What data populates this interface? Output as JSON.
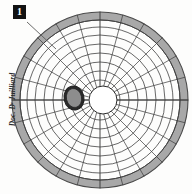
{
  "figure": {
    "badge_label": "1",
    "caption": "Doc. Dʳ Juilliard",
    "title": "",
    "background_color": "#fdfdfc"
  },
  "chart_data": {
    "type": "scatter",
    "title": "",
    "subtitle": "",
    "xlabel": "",
    "ylabel": "",
    "plot_kind": "polar-grid-visual-field-chart",
    "grid": true,
    "legend": false,
    "legend_position": "none",
    "center": {
      "x": 100,
      "y": 100
    },
    "outer_radius": 88,
    "rim": {
      "name": "outer-rim-band",
      "inner_radius": 80,
      "outer_radius": 88,
      "fill_color": "#a8a8a8",
      "stroke_color": "#4a4a4a"
    },
    "meridians": {
      "name": "radial-spokes",
      "count": 24,
      "angles_deg": [
        0,
        15,
        30,
        45,
        60,
        75,
        90,
        105,
        120,
        135,
        150,
        165,
        180,
        195,
        210,
        225,
        240,
        255,
        270,
        285,
        300,
        315,
        330,
        345
      ],
      "stroke_color": "#3c3c3c"
    },
    "isopters": {
      "name": "concentric-rings",
      "count": 8,
      "radii": [
        20,
        29,
        38,
        47,
        56,
        65,
        73,
        80
      ],
      "stroke_color": "#3c3c3c"
    },
    "optic_disc": {
      "name": "central-blind-spot",
      "center": {
        "x": 103,
        "y": 100
      },
      "radius": 14,
      "fill_color": "#ffffff",
      "stroke_color": "#2b2b2b"
    },
    "lesion": {
      "name": "scotoma-blob",
      "center": {
        "x": 74,
        "y": 98
      },
      "rx": 10,
      "ry": 12,
      "rotation_deg": -12,
      "fill_color": "#8d8d8d",
      "stroke_color": "#1f1f1f"
    },
    "leader_line": {
      "name": "annotation-pointer",
      "x1": 27,
      "y1": 22,
      "x2": 56,
      "y2": 49,
      "stroke_color": "#5a5a5a"
    },
    "horizontal_meridian": {
      "name": "horizontal-axis-line",
      "y": 100,
      "x1": 12,
      "x2": 188,
      "stroke_color": "#3c3c3c"
    },
    "axis_colors": {
      "grid": "#3c3c3c",
      "rim_fill": "#a8a8a8",
      "lesion_fill": "#8d8d8d",
      "disc_fill": "#ffffff",
      "ink": "#121212"
    }
  }
}
